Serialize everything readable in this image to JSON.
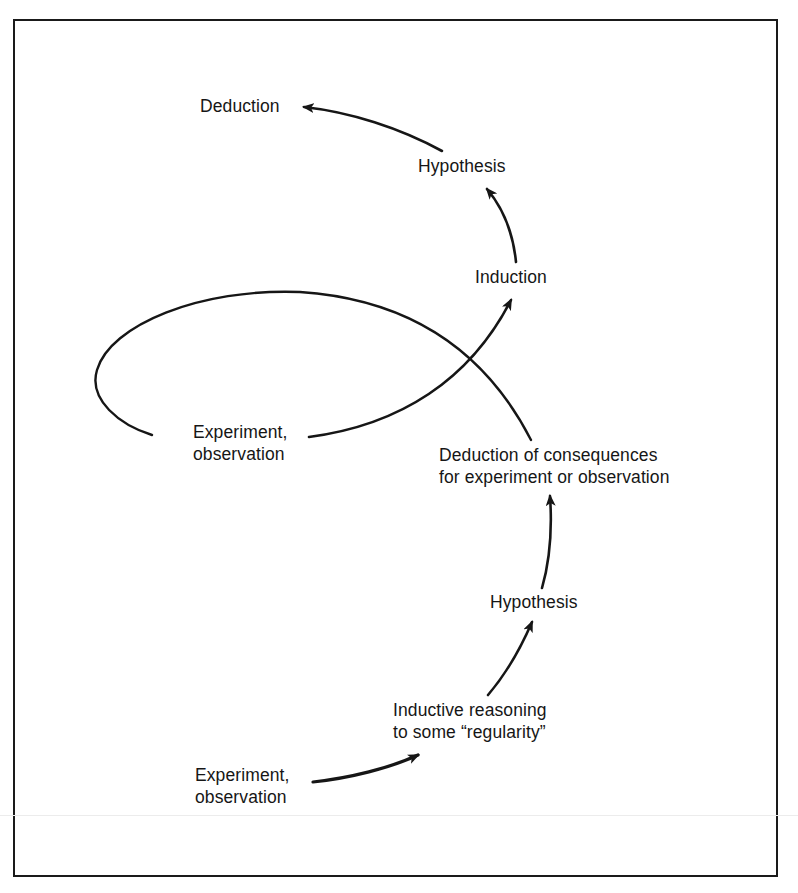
{
  "diagram": {
    "type": "flow-spiral",
    "colors": {
      "ink": "#161616",
      "background": "#ffffff"
    },
    "nodes": [
      {
        "id": "deduction_top",
        "lines": [
          "Deduction"
        ]
      },
      {
        "id": "hypothesis_top",
        "lines": [
          "Hypothesis"
        ]
      },
      {
        "id": "induction_top",
        "lines": [
          "Induction"
        ]
      },
      {
        "id": "experiment_mid",
        "lines": [
          "Experiment,",
          "observation"
        ]
      },
      {
        "id": "deduction_consequences",
        "lines": [
          "Deduction of consequences",
          "for experiment or observation"
        ]
      },
      {
        "id": "hypothesis_low",
        "lines": [
          "Hypothesis"
        ]
      },
      {
        "id": "inductive_reasoning",
        "lines": [
          "Inductive reasoning",
          "to some “regularity”"
        ]
      },
      {
        "id": "experiment_low",
        "lines": [
          "Experiment,",
          "observation"
        ]
      }
    ],
    "edges": [
      {
        "from": "experiment_low",
        "to": "inductive_reasoning",
        "arrow": true
      },
      {
        "from": "inductive_reasoning",
        "to": "hypothesis_low",
        "arrow": true
      },
      {
        "from": "hypothesis_low",
        "to": "deduction_consequences",
        "arrow": true
      },
      {
        "from": "deduction_consequences",
        "to": "experiment_mid",
        "arrow": false,
        "style": "loop"
      },
      {
        "from": "experiment_mid",
        "to": "induction_top",
        "arrow": true
      },
      {
        "from": "induction_top",
        "to": "hypothesis_top",
        "arrow": true
      },
      {
        "from": "hypothesis_top",
        "to": "deduction_top",
        "arrow": true
      }
    ]
  }
}
